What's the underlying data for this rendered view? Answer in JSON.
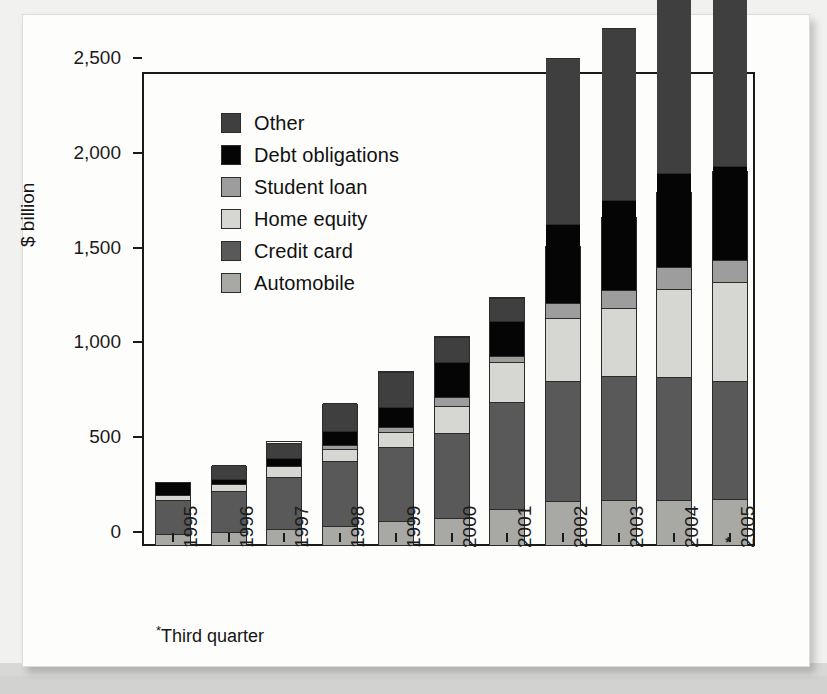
{
  "chart_data": {
    "type": "bar",
    "subtype": "stacked-bar",
    "title": "",
    "xlabel": "",
    "ylabel": "$ billion",
    "ylim": [
      0,
      2500
    ],
    "yticks": [
      "0",
      "500",
      "1,000",
      "1,500",
      "2,000",
      "2,500"
    ],
    "ytick_values": [
      0,
      500,
      1000,
      1500,
      2000,
      2500
    ],
    "grid": false,
    "legend_position": "upper-left inside",
    "categories": [
      "1995",
      "1996",
      "1997",
      "1998",
      "1999",
      "2000",
      "2001",
      "2002",
      "2003",
      "2004",
      "2005"
    ],
    "series": [
      {
        "name": "Automobile",
        "color": "#a8a8a5",
        "values": [
          60,
          70,
          85,
          100,
          125,
          140,
          190,
          230,
          240,
          240,
          245
        ]
      },
      {
        "name": "Credit card",
        "color": "#595959",
        "values": [
          175,
          215,
          275,
          345,
          390,
          450,
          565,
          635,
          650,
          645,
          620
        ]
      },
      {
        "name": "Home equity",
        "color": "#d6d6d2",
        "values": [
          30,
          35,
          55,
          60,
          80,
          145,
          210,
          330,
          360,
          465,
          520
        ]
      },
      {
        "name": "Student loan",
        "color": "#9d9d9d",
        "values": [
          0,
          0,
          0,
          20,
          25,
          45,
          30,
          80,
          95,
          115,
          120
        ]
      },
      {
        "name": "Debt obligations",
        "color": "#050505",
        "values": [
          70,
          30,
          45,
          75,
          110,
          185,
          185,
          420,
          475,
          495,
          495
        ]
      },
      {
        "name": "Other",
        "color": "#3f3f3f",
        "values": [
          0,
          70,
          80,
          150,
          185,
          130,
          125,
          875,
          905,
          955,
          965
        ]
      }
    ],
    "stack_order_bottom_to_top": [
      "Automobile",
      "Credit card",
      "Home equity",
      "Student loan",
      "Debt obligations",
      "Other"
    ],
    "totals": [
      325,
      410,
      545,
      740,
      915,
      1095,
      1305,
      1570,
      1725,
      1855,
      1965
    ],
    "segment_boundaries_note": "values are stacked bottom-to-top in $ billion",
    "footnote": "*Third quarter",
    "footnote_marker": "*",
    "footnote_applies_to": "2005"
  },
  "legend": {
    "items": [
      {
        "label": "Other",
        "swatch": "legend-swatch-other",
        "color": "#3f3f3f"
      },
      {
        "label": "Debt obligations",
        "swatch": "legend-swatch-debt",
        "color": "#050505"
      },
      {
        "label": "Student loan",
        "swatch": "legend-swatch-student",
        "color": "#9d9d9d"
      },
      {
        "label": "Home equity",
        "swatch": "legend-swatch-home",
        "color": "#d6d6d2"
      },
      {
        "label": "Credit card",
        "swatch": "legend-swatch-credit",
        "color": "#595959"
      },
      {
        "label": "Automobile",
        "swatch": "legend-swatch-auto",
        "color": "#a8a8a5"
      }
    ]
  },
  "axes": {
    "y_label": "$ billion",
    "y_ticks": [
      "2,500",
      "2,000",
      "1,500",
      "1,000",
      "500",
      "0"
    ],
    "x_ticks": [
      "1995",
      "1996",
      "1997",
      "1998",
      "1999",
      "2000",
      "2001",
      "2002",
      "2003",
      "2004",
      "2005"
    ]
  },
  "footnote": {
    "marker": "*",
    "text": "Third quarter"
  },
  "bleed_text": {
    "b1": "Investments",
    "b2": "Boise Cascade Corporation",
    "b3": "Boise Cascade Corporation",
    "b4": "Company Security Use",
    "b5": "Prospectus for Unit",
    "b6": "CIBC World Markets LLC",
    "b7": "Deutsche Bank Securities LLC",
    "b8": "A. Hughes",
    "b9": "Notes",
    "b10": "Notes",
    "b11": "Note"
  }
}
